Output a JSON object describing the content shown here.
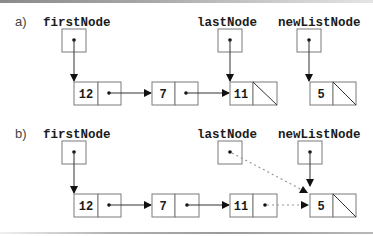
{
  "diagram": {
    "panels": [
      {
        "id": "a",
        "label": "a)",
        "variables": {
          "first": "firstNode",
          "last": "lastNode",
          "new": "newListNode"
        },
        "nodes": [
          {
            "value": "12",
            "next": "7"
          },
          {
            "value": "7",
            "next": "11"
          },
          {
            "value": "11",
            "next": null
          },
          {
            "value": "5",
            "next": null
          }
        ],
        "pointers": [
          {
            "from": "firstNode",
            "to": "12",
            "style": "solid"
          },
          {
            "from": "lastNode",
            "to": "11",
            "style": "solid"
          },
          {
            "from": "newListNode",
            "to": "5",
            "style": "solid"
          }
        ]
      },
      {
        "id": "b",
        "label": "b)",
        "variables": {
          "first": "firstNode",
          "last": "lastNode",
          "new": "newListNode"
        },
        "nodes": [
          {
            "value": "12",
            "next": "7"
          },
          {
            "value": "7",
            "next": "11"
          },
          {
            "value": "11",
            "next": "5"
          },
          {
            "value": "5",
            "next": null
          }
        ],
        "pointers": [
          {
            "from": "firstNode",
            "to": "12",
            "style": "solid"
          },
          {
            "from": "lastNode",
            "to": "5",
            "style": "dotted"
          },
          {
            "from": "newListNode",
            "to": "5",
            "style": "solid"
          },
          {
            "from": "11",
            "to": "5",
            "style": "dotted"
          }
        ]
      }
    ]
  },
  "colors": {
    "box_stroke": "#7a7a7a",
    "line": "#333333",
    "dotted_line": "#9a9a9a",
    "text": "#1a1a1a"
  }
}
